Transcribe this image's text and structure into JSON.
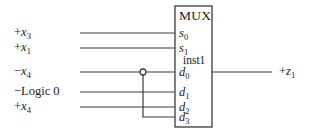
{
  "diagram": {
    "title": "MUX",
    "instance": "inst1",
    "block": {
      "name": "MUX",
      "instance_name": "inst1",
      "x": 175,
      "y": 6,
      "width": 37,
      "height": 121
    },
    "stroke_color": "#3a3a3a",
    "text_color": "#1a1a1a",
    "background_color": "#ffffff",
    "select_inputs": [
      {
        "pin": "s",
        "index": "0",
        "signal_sign": "+",
        "signal_name": "x",
        "signal_index": "3",
        "label": "+x3",
        "y": 33
      },
      {
        "pin": "s",
        "index": "1",
        "signal_sign": "+",
        "signal_name": "x",
        "signal_index": "1",
        "label": "+x1",
        "y": 48
      }
    ],
    "data_inputs": [
      {
        "pin": "d",
        "index": "0",
        "signal_sign": "−",
        "signal_name": "x",
        "signal_index": "4",
        "label": "−x4",
        "y": 72
      },
      {
        "pin": "d",
        "index": "1",
        "signal_sign": "−",
        "signal_name": "Logic 0",
        "signal_index": "",
        "label": "−Logic 0",
        "y": 92
      },
      {
        "pin": "d",
        "index": "2",
        "signal_sign": "+",
        "signal_name": "x",
        "signal_index": "4",
        "label": "+x4",
        "y": 107
      },
      {
        "pin": "d",
        "index": "3",
        "signal_sign": "",
        "signal_name": "",
        "signal_index": "",
        "label": "",
        "y": 117
      }
    ],
    "output": {
      "sign": "+",
      "name": "z",
      "index": "1",
      "label": "+z1",
      "y": 72
    },
    "junction": {
      "x": 143,
      "y": 72,
      "radius": 3,
      "connects_from_pin": "d0",
      "connects_to_pin": "d3"
    },
    "wires": {
      "left_start_x": 80,
      "block_left_x": 175,
      "block_right_x": 212,
      "output_end_x": 272
    }
  }
}
